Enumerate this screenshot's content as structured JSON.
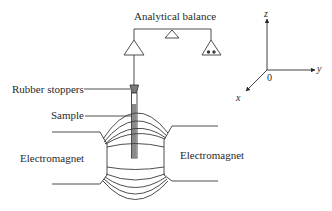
{
  "diagram": {
    "labels": {
      "analytical_balance": "Analytical balance",
      "rubber_stoppers": "Rubber stoppers",
      "sample": "Sample",
      "electromagnet_left": "Electromagnet",
      "electromagnet_right": "Electromagnet"
    },
    "axes": {
      "z": "z",
      "y": "y",
      "x": "x",
      "origin": "0"
    },
    "colors": {
      "line": "#3a3a3a",
      "sample_fill": "#8a8a8a",
      "stopper_fill": "#7a7a7a",
      "background": "#ffffff"
    },
    "components": [
      "analytical-balance-beam",
      "fulcrum",
      "left-pan",
      "right-pan-with-weights",
      "suspension-wire",
      "rubber-stopper",
      "sample-tube",
      "left-electromagnet-pole",
      "right-electromagnet-pole",
      "magnetic-field-lines",
      "coordinate-axes"
    ]
  }
}
